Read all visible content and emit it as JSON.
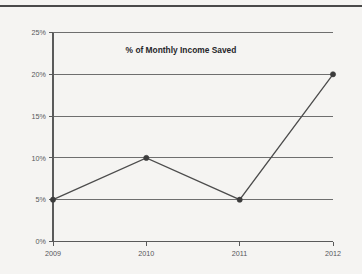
{
  "page": {
    "top_rule_color": "#4a4a4a",
    "background_color": "#f5f4f2"
  },
  "chart_data": {
    "type": "line",
    "title": "% of Monthly Income Saved",
    "xlabel": "",
    "ylabel": "",
    "categories": [
      "2009",
      "2010",
      "2011",
      "2012"
    ],
    "values": [
      5,
      10,
      5,
      20
    ],
    "value_suffix": "%",
    "ylim": [
      0,
      25
    ],
    "ytick_step": 5,
    "ytick_labels": [
      "0%",
      "5%",
      "10%",
      "15%",
      "20%",
      "25%"
    ],
    "ytick_values": [
      0,
      5,
      10,
      15,
      20,
      25
    ],
    "xtick_labels": [
      "2009",
      "2010",
      "2011",
      "2012"
    ],
    "grid": "horizontal",
    "legend": "none",
    "series": [
      {
        "name": "% of Monthly Income Saved",
        "values": [
          5,
          10,
          5,
          20
        ],
        "line_color": "#4c4c4c",
        "marker_color": "#3c3c3c"
      }
    ],
    "grid_color": "#6e6e6e",
    "axis_color": "#5a5a5a"
  }
}
